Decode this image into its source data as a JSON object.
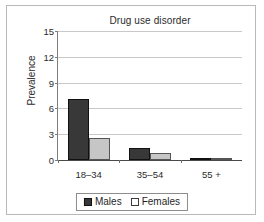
{
  "chart_data": {
    "type": "bar",
    "title": "Drug use disorder",
    "xlabel": "",
    "ylabel": "Prevalence",
    "categories": [
      "18–34",
      "35–54",
      "55 +"
    ],
    "series": [
      {
        "name": "Males",
        "color": "#383838",
        "values": [
          7.0,
          1.4,
          0.05
        ]
      },
      {
        "name": "Females",
        "color": "#c6c6c6",
        "values": [
          2.5,
          0.8,
          0.2
        ]
      }
    ],
    "ylim": [
      0,
      15
    ],
    "yticks": [
      0,
      3,
      6,
      9,
      12,
      15
    ],
    "ytick_labels": [
      "0",
      "3",
      "6",
      "9",
      "12",
      "15"
    ],
    "grid": true,
    "legend_position": "bottom"
  }
}
